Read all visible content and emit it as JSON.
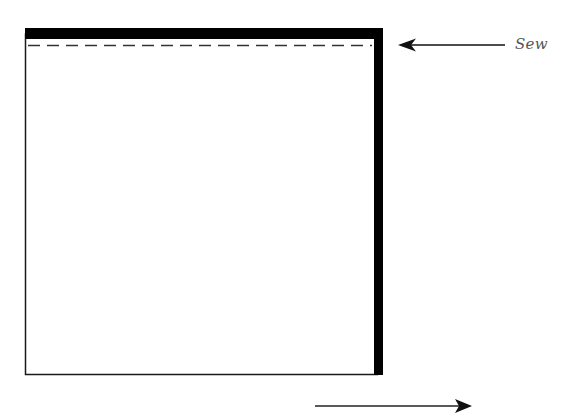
{
  "diagram": {
    "type": "sewing-instruction",
    "annotations": {
      "sew_label": "Sew"
    },
    "colors": {
      "fabric_edge": "#1a1a1a",
      "binding": "#000000",
      "seam_line": "#333333",
      "arrow": "#111111",
      "label": "#555555",
      "background": "#ffffff"
    },
    "elements": [
      {
        "id": "fabric-square",
        "shape": "rectangle",
        "description": "Fabric square with thin outline"
      },
      {
        "id": "top-binding",
        "shape": "thick-bar",
        "description": "Binding strip along top edge"
      },
      {
        "id": "right-binding",
        "shape": "thick-bar",
        "description": "Binding strip along right edge"
      },
      {
        "id": "seam-line",
        "shape": "dashed-line",
        "description": "Stitch line just below top binding"
      },
      {
        "id": "sew-arrow",
        "shape": "arrow-left",
        "description": "Arrow pointing to seam line"
      },
      {
        "id": "direction-arrow",
        "shape": "arrow-right",
        "description": "Arrow indicating direction below square"
      }
    ]
  }
}
